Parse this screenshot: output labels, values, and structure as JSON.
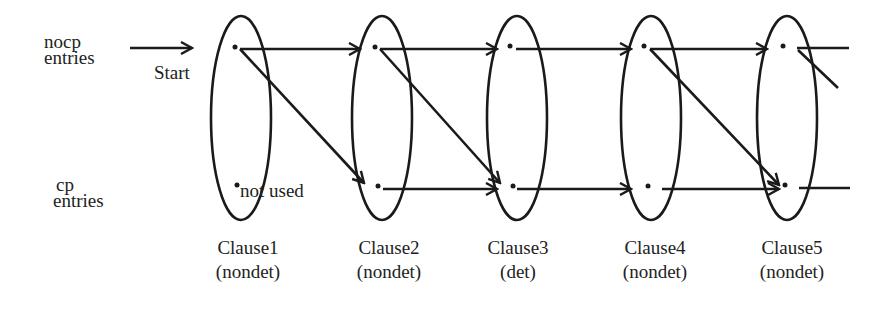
{
  "rows": {
    "nocp": {
      "line1": "nocp",
      "line2": "entries"
    },
    "cp": {
      "line1": "cp",
      "line2": "entries"
    }
  },
  "start_label": "Start",
  "not_used_label": "not used",
  "clauses": [
    {
      "name": "Clause1",
      "type": "(nondet)",
      "cx": 241
    },
    {
      "name": "Clause2",
      "type": "(nondet)",
      "cx": 382
    },
    {
      "name": "Clause3",
      "type": "(det)",
      "cx": 517
    },
    {
      "name": "Clause4",
      "type": "(nondet)",
      "cx": 651
    },
    {
      "name": "Clause5",
      "type": "(nondet)",
      "cx": 787
    }
  ],
  "geometry": {
    "top_row_y": 48,
    "bottom_row_y": 187,
    "ellipse_rx": 30,
    "ellipse_ry": 102,
    "ellipse_cy": 118,
    "stroke_color": "#1a1a1a"
  }
}
